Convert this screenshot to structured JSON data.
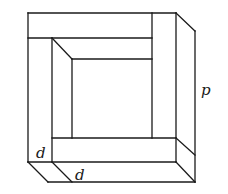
{
  "diagram": {
    "labels": {
      "thickness_side": "d",
      "thickness_front": "d",
      "outer_side": "p"
    },
    "colors": {
      "stroke": "#1a1a1a",
      "background": "#ffffff"
    }
  }
}
